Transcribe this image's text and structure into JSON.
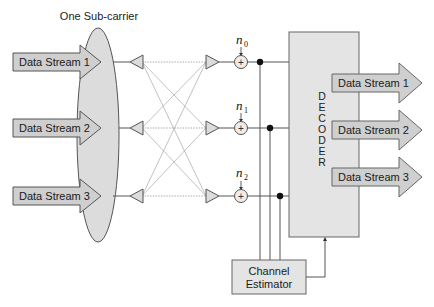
{
  "title": "One Sub-carrier",
  "inputs": [
    {
      "label": "Data Stream 1"
    },
    {
      "label": "Data Stream 2"
    },
    {
      "label": "Data Stream 3"
    }
  ],
  "noise": [
    {
      "symbol": "n",
      "sub": "0"
    },
    {
      "symbol": "n",
      "sub": "1"
    },
    {
      "symbol": "n",
      "sub": "2"
    }
  ],
  "adder_symbol": "+",
  "decoder": {
    "letters": [
      "D",
      "E",
      "C",
      "O",
      "D",
      "E",
      "R"
    ]
  },
  "outputs": [
    {
      "label": "Data Stream 1"
    },
    {
      "label": "Data Stream 2"
    },
    {
      "label": "Data Stream 3"
    }
  ],
  "estimator": {
    "line1": "Channel",
    "line2": "Estimator"
  },
  "colors": {
    "fill_gray": "#d9d9d9",
    "arrow_fill": "#cfcfcf",
    "box_fill": "#e6e6e6",
    "stroke": "#555555"
  }
}
